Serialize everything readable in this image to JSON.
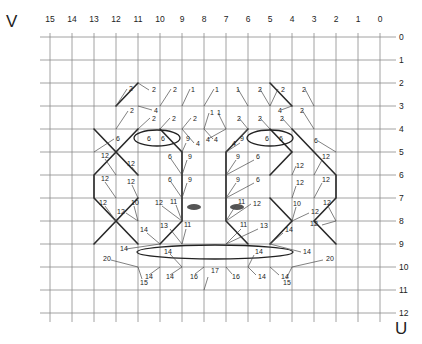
{
  "axes": {
    "v_letter": "V",
    "u_letter": "U",
    "columns": [
      "15",
      "14",
      "13",
      "12",
      "11",
      "10",
      "9",
      "8",
      "7",
      "6",
      "5",
      "4",
      "3",
      "2",
      "1",
      "0"
    ],
    "rows": [
      "0",
      "1",
      "2",
      "3",
      "4",
      "5",
      "6",
      "7",
      "8",
      "9",
      "10",
      "11",
      "12"
    ]
  },
  "grid": {
    "x0": 50,
    "dx": 22,
    "y0": 37,
    "dy": 23,
    "left": 40,
    "right": 390,
    "top": 37,
    "bottom": 322
  },
  "thick_paths": [
    "M94,129 L116,152 L94,175 L94,198 L116,221 L94,244",
    "M138,129 L116,152 L138,175",
    "M138,198 L116,221 L138,244",
    "M160,129 L182,152 L182,221 L160,244",
    "M292,129 L314,152 L336,175 L336,198 L314,221 L336,244",
    "M270,129 L292,152 L270,175",
    "M270,198 L292,221 L270,244",
    "M248,129 L226,152 L226,221 L248,244",
    "M138,83 L116,106",
    "M270,83 L292,106"
  ],
  "ellipses": [
    {
      "name": "left-upper-ellipse",
      "cx": 157,
      "cy": 138,
      "rx": 23,
      "ry": 8
    },
    {
      "name": "right-upper-ellipse",
      "cx": 270,
      "cy": 138,
      "rx": 23,
      "ry": 8
    },
    {
      "name": "lower-ellipse",
      "cx": 215,
      "cy": 252,
      "rx": 78,
      "ry": 7
    }
  ],
  "eyes": [
    {
      "name": "left-eye-mark",
      "cx": 194,
      "cy": 207,
      "rx": 7,
      "ry": 3
    },
    {
      "name": "right-eye-mark",
      "cx": 237,
      "cy": 207,
      "rx": 7,
      "ry": 3
    }
  ],
  "labels": [
    {
      "t": "2",
      "x": 129,
      "y": 91,
      "lx1": 116,
      "ly1": 106,
      "lx2": 127,
      "ly2": 89
    },
    {
      "t": "2",
      "x": 152,
      "y": 92,
      "lx1": 138,
      "ly1": 83,
      "lx2": 149,
      "ly2": 90
    },
    {
      "t": "2",
      "x": 173,
      "y": 92,
      "lx1": 160,
      "ly1": 106,
      "lx2": 171,
      "ly2": 89
    },
    {
      "t": "1",
      "x": 191,
      "y": 92,
      "lx1": 182,
      "ly1": 106,
      "lx2": 190,
      "ly2": 89
    },
    {
      "t": "1",
      "x": 215,
      "y": 92,
      "lx1": 204,
      "ly1": 106,
      "lx2": 214,
      "ly2": 89
    },
    {
      "t": "1",
      "x": 236,
      "y": 92,
      "lx1": 248,
      "ly1": 106,
      "lx2": 238,
      "ly2": 89
    },
    {
      "t": "2",
      "x": 258,
      "y": 92,
      "lx1": 270,
      "ly1": 106,
      "lx2": 260,
      "ly2": 89
    },
    {
      "t": "2",
      "x": 281,
      "y": 92,
      "lx1": 270,
      "ly1": 106,
      "lx2": 278,
      "ly2": 89
    },
    {
      "t": "2",
      "x": 302,
      "y": 92,
      "lx1": 314,
      "ly1": 106,
      "lx2": 305,
      "ly2": 89
    },
    {
      "t": "2",
      "x": 130,
      "y": 113,
      "lx1": 116,
      "ly1": 129,
      "lx2": 128,
      "ly2": 111
    },
    {
      "t": "4",
      "x": 154,
      "y": 113,
      "lx1": 138,
      "ly1": 106,
      "lx2": 152,
      "ly2": 110
    },
    {
      "t": "2",
      "x": 152,
      "y": 121,
      "lx1": 138,
      "ly1": 129,
      "lx2": 150,
      "ly2": 118
    },
    {
      "t": "2",
      "x": 172,
      "y": 121,
      "lx1": 160,
      "ly1": 129,
      "lx2": 170,
      "ly2": 118
    },
    {
      "t": "2",
      "x": 193,
      "y": 121,
      "lx1": 182,
      "ly1": 129,
      "lx2": 191,
      "ly2": 118
    },
    {
      "t": "1",
      "x": 210,
      "y": 115,
      "lx1": 204,
      "ly1": 129,
      "lx2": 209,
      "ly2": 113
    },
    {
      "t": "1",
      "x": 217,
      "y": 115,
      "lx1": 226,
      "ly1": 129,
      "lx2": 218,
      "ly2": 113
    },
    {
      "t": "2",
      "x": 237,
      "y": 121,
      "lx1": 248,
      "ly1": 129,
      "lx2": 239,
      "ly2": 118
    },
    {
      "t": "2",
      "x": 258,
      "y": 121,
      "lx1": 270,
      "ly1": 129,
      "lx2": 260,
      "ly2": 118
    },
    {
      "t": "4",
      "x": 278,
      "y": 113,
      "lx1": 292,
      "ly1": 106,
      "lx2": 281,
      "ly2": 110
    },
    {
      "t": "2",
      "x": 280,
      "y": 121,
      "lx1": 292,
      "ly1": 129,
      "lx2": 282,
      "ly2": 118
    },
    {
      "t": "2",
      "x": 300,
      "y": 113,
      "lx1": 314,
      "ly1": 129,
      "lx2": 302,
      "ly2": 110
    },
    {
      "t": "4",
      "x": 214,
      "y": 142,
      "lx1": 204,
      "ly1": 129,
      "lx2": 213,
      "ly2": 139
    },
    {
      "t": "4",
      "x": 206,
      "y": 142,
      "lx1": 226,
      "ly1": 129,
      "lx2": 208,
      "ly2": 139
    },
    {
      "t": "6",
      "x": 116,
      "y": 141,
      "lx1": 94,
      "ly1": 152,
      "lx2": 114,
      "ly2": 139
    },
    {
      "t": "6",
      "x": 147,
      "y": 141,
      "lx1": 0,
      "ly1": 0,
      "lx2": 0,
      "ly2": 0
    },
    {
      "t": "6",
      "x": 161,
      "y": 141,
      "lx1": 0,
      "ly1": 0,
      "lx2": 0,
      "ly2": 0
    },
    {
      "t": "9",
      "x": 186,
      "y": 141,
      "lx1": 182,
      "ly1": 152,
      "lx2": 186,
      "ly2": 143
    },
    {
      "t": "4",
      "x": 196,
      "y": 146,
      "lx1": 182,
      "ly1": 129,
      "lx2": 194,
      "ly2": 143
    },
    {
      "t": "9",
      "x": 240,
      "y": 141,
      "lx1": 226,
      "ly1": 152,
      "lx2": 240,
      "ly2": 143
    },
    {
      "t": "4",
      "x": 232,
      "y": 146,
      "lx1": 248,
      "ly1": 129,
      "lx2": 234,
      "ly2": 143
    },
    {
      "t": "6",
      "x": 265,
      "y": 141,
      "lx1": 0,
      "ly1": 0,
      "lx2": 0,
      "ly2": 0
    },
    {
      "t": "6",
      "x": 279,
      "y": 141,
      "lx1": 0,
      "ly1": 0,
      "lx2": 0,
      "ly2": 0
    },
    {
      "t": "6",
      "x": 314,
      "y": 143,
      "lx1": 336,
      "ly1": 152,
      "lx2": 318,
      "ly2": 141
    },
    {
      "t": "12",
      "x": 101,
      "y": 158,
      "lx1": 116,
      "ly1": 175,
      "lx2": 105,
      "ly2": 159
    },
    {
      "t": "12",
      "x": 127,
      "y": 166,
      "lx1": 138,
      "ly1": 175,
      "lx2": 132,
      "ly2": 167
    },
    {
      "t": "6",
      "x": 168,
      "y": 159,
      "lx1": 182,
      "ly1": 175,
      "lx2": 171,
      "ly2": 159
    },
    {
      "t": "9",
      "x": 188,
      "y": 159,
      "lx1": 182,
      "ly1": 175,
      "lx2": 187,
      "ly2": 160
    },
    {
      "t": "9",
      "x": 236,
      "y": 159,
      "lx1": 226,
      "ly1": 175,
      "lx2": 236,
      "ly2": 160
    },
    {
      "t": "6",
      "x": 256,
      "y": 159,
      "lx1": 226,
      "ly1": 175,
      "lx2": 254,
      "ly2": 160
    },
    {
      "t": "12",
      "x": 296,
      "y": 168,
      "lx1": 292,
      "ly1": 175,
      "lx2": 296,
      "ly2": 166
    },
    {
      "t": "12",
      "x": 322,
      "y": 159,
      "lx1": 314,
      "ly1": 175,
      "lx2": 322,
      "ly2": 160
    },
    {
      "t": "12",
      "x": 101,
      "y": 181,
      "lx1": 116,
      "ly1": 198,
      "lx2": 105,
      "ly2": 182
    },
    {
      "t": "12",
      "x": 127,
      "y": 184,
      "lx1": 138,
      "ly1": 198,
      "lx2": 132,
      "ly2": 185
    },
    {
      "t": "6",
      "x": 168,
      "y": 182,
      "lx1": 182,
      "ly1": 198,
      "lx2": 171,
      "ly2": 182
    },
    {
      "t": "9",
      "x": 188,
      "y": 182,
      "lx1": 182,
      "ly1": 198,
      "lx2": 187,
      "ly2": 183
    },
    {
      "t": "9",
      "x": 236,
      "y": 182,
      "lx1": 226,
      "ly1": 198,
      "lx2": 236,
      "ly2": 183
    },
    {
      "t": "6",
      "x": 256,
      "y": 182,
      "lx1": 226,
      "ly1": 198,
      "lx2": 254,
      "ly2": 183
    },
    {
      "t": "12",
      "x": 296,
      "y": 185,
      "lx1": 292,
      "ly1": 198,
      "lx2": 296,
      "ly2": 186
    },
    {
      "t": "12",
      "x": 322,
      "y": 182,
      "lx1": 314,
      "ly1": 198,
      "lx2": 322,
      "ly2": 183
    },
    {
      "t": "12",
      "x": 99,
      "y": 205,
      "lx1": 116,
      "ly1": 221,
      "lx2": 105,
      "ly2": 206
    },
    {
      "t": "10",
      "x": 131,
      "y": 205,
      "lx1": 138,
      "ly1": 221,
      "lx2": 134,
      "ly2": 206
    },
    {
      "t": "12",
      "x": 117,
      "y": 214,
      "lx1": 138,
      "ly1": 221,
      "lx2": 126,
      "ly2": 213
    },
    {
      "t": "12",
      "x": 155,
      "y": 205,
      "lx1": 182,
      "ly1": 221,
      "lx2": 162,
      "ly2": 206
    },
    {
      "t": "11",
      "x": 170,
      "y": 204,
      "lx1": 182,
      "ly1": 221,
      "lx2": 176,
      "ly2": 205
    },
    {
      "t": "11",
      "x": 238,
      "y": 204,
      "lx1": 226,
      "ly1": 221,
      "lx2": 236,
      "ly2": 205
    },
    {
      "t": "12",
      "x": 253,
      "y": 206,
      "lx1": 226,
      "ly1": 221,
      "lx2": 251,
      "ly2": 204
    },
    {
      "t": "10",
      "x": 293,
      "y": 206,
      "lx1": 292,
      "ly1": 221,
      "lx2": 296,
      "ly2": 207
    },
    {
      "t": "12",
      "x": 311,
      "y": 214,
      "lx1": 292,
      "ly1": 221,
      "lx2": 309,
      "ly2": 213
    },
    {
      "t": "12",
      "x": 323,
      "y": 205,
      "lx1": 336,
      "ly1": 221,
      "lx2": 328,
      "ly2": 206
    },
    {
      "t": "12",
      "x": 310,
      "y": 226,
      "lx1": 336,
      "ly1": 221,
      "lx2": 322,
      "ly2": 225
    },
    {
      "t": "14",
      "x": 140,
      "y": 232,
      "lx1": 160,
      "ly1": 244,
      "lx2": 147,
      "ly2": 233
    },
    {
      "t": "13",
      "x": 160,
      "y": 228,
      "lx1": 182,
      "ly1": 244,
      "lx2": 170,
      "ly2": 229
    },
    {
      "t": "11",
      "x": 184,
      "y": 227,
      "lx1": 182,
      "ly1": 244,
      "lx2": 186,
      "ly2": 229
    },
    {
      "t": "11",
      "x": 240,
      "y": 227,
      "lx1": 226,
      "ly1": 244,
      "lx2": 241,
      "ly2": 229
    },
    {
      "t": "13",
      "x": 260,
      "y": 228,
      "lx1": 226,
      "ly1": 244,
      "lx2": 258,
      "ly2": 229
    },
    {
      "t": "14",
      "x": 285,
      "y": 232,
      "lx1": 270,
      "ly1": 244,
      "lx2": 283,
      "ly2": 233
    },
    {
      "t": "14",
      "x": 120,
      "y": 251,
      "lx1": 160,
      "ly1": 244,
      "lx2": 126,
      "ly2": 249
    },
    {
      "t": "14",
      "x": 164,
      "y": 254,
      "lx1": 182,
      "ly1": 267,
      "lx2": 170,
      "ly2": 254
    },
    {
      "t": "14",
      "x": 255,
      "y": 254,
      "lx1": 248,
      "ly1": 267,
      "lx2": 254,
      "ly2": 255
    },
    {
      "t": "14",
      "x": 303,
      "y": 254,
      "lx1": 270,
      "ly1": 244,
      "lx2": 301,
      "ly2": 252
    },
    {
      "t": "20",
      "x": 103,
      "y": 261,
      "lx1": 138,
      "ly1": 267,
      "lx2": 111,
      "ly2": 260
    },
    {
      "t": "20",
      "x": 326,
      "y": 261,
      "lx1": 292,
      "ly1": 267,
      "lx2": 323,
      "ly2": 260
    },
    {
      "t": "14",
      "x": 145,
      "y": 279,
      "lx1": 160,
      "ly1": 267,
      "lx2": 149,
      "ly2": 275
    },
    {
      "t": "15",
      "x": 140,
      "y": 285,
      "lx1": 138,
      "ly1": 267,
      "lx2": 142,
      "ly2": 279
    },
    {
      "t": "14",
      "x": 166,
      "y": 279,
      "lx1": 182,
      "ly1": 267,
      "lx2": 170,
      "ly2": 275
    },
    {
      "t": "16",
      "x": 190,
      "y": 279,
      "lx1": 204,
      "ly1": 267,
      "lx2": 195,
      "ly2": 274
    },
    {
      "t": "17",
      "x": 211,
      "y": 273,
      "lx1": 204,
      "ly1": 290,
      "lx2": 208,
      "ly2": 277
    },
    {
      "t": "16",
      "x": 232,
      "y": 279,
      "lx1": 226,
      "ly1": 267,
      "lx2": 232,
      "ly2": 274
    },
    {
      "t": "14",
      "x": 258,
      "y": 279,
      "lx1": 248,
      "ly1": 267,
      "lx2": 256,
      "ly2": 275
    },
    {
      "t": "14",
      "x": 281,
      "y": 279,
      "lx1": 270,
      "ly1": 267,
      "lx2": 279,
      "ly2": 275
    },
    {
      "t": "15",
      "x": 283,
      "y": 285,
      "lx1": 292,
      "ly1": 267,
      "lx2": 286,
      "ly2": 279
    }
  ]
}
